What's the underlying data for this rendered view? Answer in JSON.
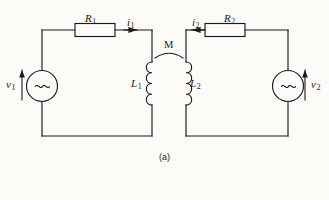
{
  "figure": {
    "caption": "(a)",
    "type": "coupled-inductor-two-loop-circuit",
    "background_color": "#fcfbf7",
    "line_color": "#1a1a1a"
  },
  "labels": {
    "r1": {
      "symbol": "R",
      "sub": "1"
    },
    "r2": {
      "symbol": "R",
      "sub": "2"
    },
    "i1": {
      "symbol": "i",
      "sub": "1"
    },
    "i2": {
      "symbol": "i",
      "sub": "2"
    },
    "l1": {
      "symbol": "L",
      "sub": "1"
    },
    "l2": {
      "symbol": "L",
      "sub": "2"
    },
    "v1": {
      "symbol": "v",
      "sub": "1"
    },
    "v2": {
      "symbol": "v",
      "sub": "2"
    },
    "m": {
      "symbol": "M",
      "sub": ""
    }
  },
  "components": {
    "resistor_left": {
      "name": "R1",
      "shape": "rectangle"
    },
    "resistor_right": {
      "name": "R2",
      "shape": "rectangle"
    },
    "inductor_left": {
      "name": "L1",
      "shape": "coil",
      "loops": 4,
      "bumps_face": "left"
    },
    "inductor_right": {
      "name": "L2",
      "shape": "coil",
      "loops": 4,
      "bumps_face": "right"
    },
    "source_left": {
      "name": "v1",
      "shape": "circle",
      "glyph": "~"
    },
    "source_right": {
      "name": "v2",
      "shape": "circle",
      "glyph": "~"
    },
    "mutual_coupling": {
      "name": "M",
      "shape": "arc"
    }
  },
  "arrows": {
    "i1_direction": "right",
    "i2_direction": "left",
    "v1_direction": "up",
    "v2_direction": "up"
  }
}
